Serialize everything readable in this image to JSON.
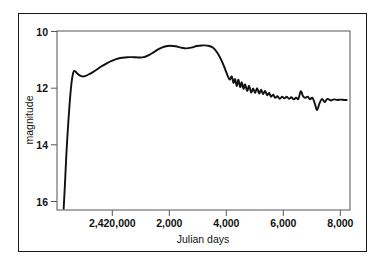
{
  "figure": {
    "background_color": "#ffffff",
    "border_color": "#1a1a1a",
    "curve_color": "#111111"
  },
  "chart_data": {
    "type": "line",
    "title": "",
    "subtitle": "",
    "xlabel": "Julian days",
    "ylabel": "magnitude",
    "grid": false,
    "legend": null,
    "y_inverted": true,
    "xlim": [
      2419600,
      2428400
    ],
    "ylim": [
      16.6,
      9.9
    ],
    "x_ticks": [
      2420000,
      2422000,
      2424000,
      2426000,
      2428000
    ],
    "x_tick_labels": [
      "2,420,000",
      "2,000",
      "4,000",
      "6,000",
      "8,000"
    ],
    "y_ticks": [
      10,
      12,
      14,
      16
    ],
    "y_tick_labels": [
      "10",
      "12",
      "14",
      "16"
    ],
    "series": [
      {
        "name": "light curve",
        "x": [
          2419800,
          2419840,
          2419880,
          2419920,
          2419960,
          2420000,
          2420040,
          2420090,
          2420140,
          2420200,
          2420280,
          2420360,
          2420460,
          2420560,
          2420680,
          2420800,
          2420940,
          2421080,
          2421240,
          2421400,
          2421560,
          2421720,
          2421880,
          2422040,
          2422200,
          2422360,
          2422520,
          2422680,
          2422840,
          2423000,
          2423160,
          2423320,
          2423480,
          2423640,
          2423800,
          2423960,
          2424120,
          2424280,
          2424420,
          2424540,
          2424640,
          2424720,
          2424790,
          2424850,
          2424900,
          2424950,
          2425000,
          2425050,
          2425100,
          2425150,
          2425200,
          2425250,
          2425310,
          2425370,
          2425430,
          2425490,
          2425550,
          2425610,
          2425670,
          2425730,
          2425790,
          2425850,
          2425910,
          2425970,
          2426030,
          2426090,
          2426150,
          2426220,
          2426290,
          2426360,
          2426430,
          2426500,
          2426570,
          2426640,
          2426710,
          2426780,
          2426850,
          2426920,
          2426990,
          2427060,
          2427130,
          2427200,
          2427270,
          2427340,
          2427410,
          2427480,
          2427560,
          2427640,
          2427720,
          2427820,
          2427920,
          2428020,
          2428120,
          2428220,
          2428300
        ],
        "y": [
          16.55,
          15.6,
          14.55,
          13.7,
          12.95,
          12.3,
          11.8,
          11.45,
          11.4,
          11.48,
          11.56,
          11.6,
          11.58,
          11.52,
          11.44,
          11.34,
          11.22,
          11.12,
          11.02,
          10.94,
          10.9,
          10.88,
          10.88,
          10.89,
          10.88,
          10.8,
          10.68,
          10.56,
          10.48,
          10.45,
          10.47,
          10.52,
          10.55,
          10.52,
          10.46,
          10.44,
          10.45,
          10.52,
          10.72,
          11.0,
          11.3,
          11.56,
          11.72,
          11.6,
          11.84,
          11.7,
          11.96,
          11.72,
          12.0,
          11.82,
          12.06,
          11.9,
          12.14,
          11.95,
          12.2,
          12.05,
          12.22,
          12.04,
          12.24,
          12.1,
          12.26,
          12.14,
          12.3,
          12.22,
          12.36,
          12.28,
          12.4,
          12.34,
          12.44,
          12.36,
          12.42,
          12.36,
          12.44,
          12.38,
          12.46,
          12.4,
          12.44,
          12.16,
          12.34,
          12.4,
          12.36,
          12.46,
          12.4,
          12.6,
          12.86,
          12.62,
          12.44,
          12.56,
          12.44,
          12.5,
          12.46,
          12.48,
          12.47,
          12.48,
          12.48
        ]
      }
    ]
  }
}
